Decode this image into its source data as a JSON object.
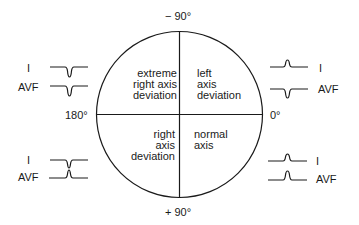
{
  "axis_labels": {
    "top": "− 90°",
    "bottom": "+ 90°",
    "left": "180°",
    "right": "0°"
  },
  "quadrants": {
    "top_left": [
      "extreme",
      "right axis",
      "deviation"
    ],
    "top_right": [
      "left",
      "axis",
      "deviation"
    ],
    "bottom_left": [
      "right",
      "axis",
      "deviation"
    ],
    "bottom_right": [
      "normal",
      "axis"
    ]
  },
  "leads": {
    "top_left": {
      "lead1": "I",
      "lead2": "AVF",
      "lead1_deflection": "negative",
      "lead2_deflection": "negative"
    },
    "top_right": {
      "lead1": "I",
      "lead2": "AVF",
      "lead1_deflection": "positive",
      "lead2_deflection": "negative"
    },
    "bottom_left": {
      "lead1": "I",
      "lead2": "AVF",
      "lead1_deflection": "negative",
      "lead2_deflection": "positive"
    },
    "bottom_right": {
      "lead1": "I",
      "lead2": "AVF",
      "lead1_deflection": "positive",
      "lead2_deflection": "positive"
    }
  }
}
